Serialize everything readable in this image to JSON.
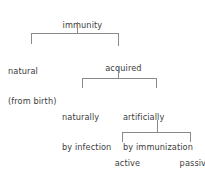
{
  "diagram": {
    "type": "hierarchy-tree",
    "line_color": "#8a8a8a",
    "text_color": "#3d3d3d",
    "background_color": "#ffffff",
    "nodes": {
      "root": {
        "label": "immunity"
      },
      "natural": {
        "line1": "natural",
        "line2": "(from birth)"
      },
      "acquired": {
        "label": "acquired"
      },
      "naturally": {
        "line1": "naturally",
        "line2": "by infection",
        "line3": "(active)"
      },
      "artificially": {
        "line1": "artificially",
        "line2": "by immunization"
      },
      "active": {
        "label": "active"
      },
      "passive": {
        "label": "passive"
      }
    }
  }
}
